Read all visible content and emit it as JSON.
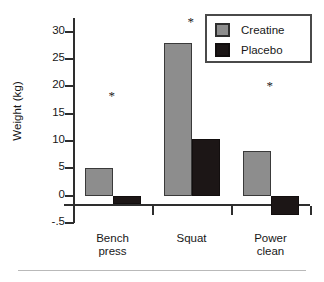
{
  "chart_data": {
    "type": "bar",
    "title": "",
    "xlabel": "",
    "ylabel": "Weight (kg)",
    "categories": [
      "Bench press",
      "Squat",
      "Power clean"
    ],
    "category_lines": [
      [
        "Bench",
        "press"
      ],
      [
        "Squat"
      ],
      [
        "Power",
        "clean"
      ]
    ],
    "series": [
      {
        "name": "Creatine",
        "color": "#8d8d8d",
        "values": [
          5.0,
          28.0,
          8.2
        ]
      },
      {
        "name": "Placebo",
        "color": "#1c1616",
        "values": [
          -1.5,
          10.3,
          -3.5
        ]
      }
    ],
    "ylim": [
      -5,
      32.5
    ],
    "yticks": [
      30,
      25,
      20,
      15,
      10,
      5,
      0,
      -5
    ],
    "ytick_labels": [
      "30",
      "25",
      "20",
      "15",
      "10",
      "5",
      "0",
      "-.5"
    ],
    "grid": false,
    "legend_position": "top-right",
    "annotations": [
      {
        "text": "*",
        "category": "Bench press",
        "y": 18.5
      },
      {
        "text": "*",
        "category": "Squat",
        "y": 32.0
      },
      {
        "text": "*",
        "category": "Power clean",
        "y": 20.2
      }
    ]
  },
  "legend": {
    "items": [
      {
        "label": "Creatine"
      },
      {
        "label": "Placebo"
      }
    ]
  },
  "axis": {
    "y_title": "Weight (kg)"
  }
}
